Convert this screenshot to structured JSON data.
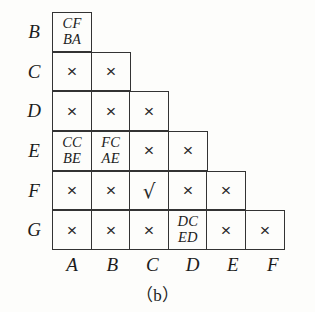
{
  "figure": {
    "caption": "（b）",
    "row_labels": [
      "B",
      "C",
      "D",
      "E",
      "F",
      "G"
    ],
    "column_labels": [
      "A",
      "B",
      "C",
      "D",
      "E",
      "F"
    ],
    "glyphs": {
      "cross": "×",
      "check": "√"
    },
    "colors": {
      "background": "#fdfdfb",
      "border": "#333333",
      "text": "#1c1c1c"
    },
    "rows": [
      {
        "label": "B",
        "cells": [
          {
            "type": "pair",
            "top": "CF",
            "bottom": "BA"
          }
        ]
      },
      {
        "label": "C",
        "cells": [
          {
            "type": "cross",
            "mark": "×"
          },
          {
            "type": "cross",
            "mark": "×"
          }
        ]
      },
      {
        "label": "D",
        "cells": [
          {
            "type": "cross",
            "mark": "×"
          },
          {
            "type": "cross",
            "mark": "×"
          },
          {
            "type": "cross",
            "mark": "×"
          }
        ]
      },
      {
        "label": "E",
        "cells": [
          {
            "type": "pair",
            "top": "CC",
            "bottom": "BE"
          },
          {
            "type": "pair",
            "top": "FC",
            "bottom": "AE"
          },
          {
            "type": "cross",
            "mark": "×"
          },
          {
            "type": "cross",
            "mark": "×"
          }
        ]
      },
      {
        "label": "F",
        "cells": [
          {
            "type": "cross",
            "mark": "×"
          },
          {
            "type": "cross",
            "mark": "×"
          },
          {
            "type": "check",
            "mark": "√"
          },
          {
            "type": "cross",
            "mark": "×"
          },
          {
            "type": "cross",
            "mark": "×"
          }
        ]
      },
      {
        "label": "G",
        "cells": [
          {
            "type": "cross",
            "mark": "×"
          },
          {
            "type": "cross",
            "mark": "×"
          },
          {
            "type": "cross",
            "mark": "×"
          },
          {
            "type": "pair",
            "top": "DC",
            "bottom": "ED"
          },
          {
            "type": "cross",
            "mark": "×"
          },
          {
            "type": "cross",
            "mark": "×"
          }
        ]
      }
    ]
  }
}
